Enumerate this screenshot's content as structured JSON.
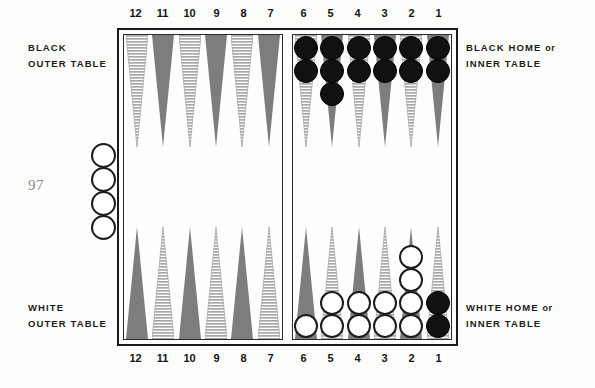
{
  "page": {
    "number": "97",
    "background_color": "#fdfdfb"
  },
  "labels": {
    "black_outer_line1": "BLACK",
    "black_outer_line2": "OUTER TABLE",
    "white_outer_line1": "WHITE",
    "white_outer_line2": "OUTER TABLE",
    "black_home_line1": "BLACK HOME",
    "black_home_or": "or",
    "black_home_line2": "INNER TABLE",
    "white_home_line1": "WHITE HOME",
    "white_home_or": "or",
    "white_home_line2": "INNER TABLE"
  },
  "point_numbers": {
    "outer": [
      "12",
      "11",
      "10",
      "9",
      "8",
      "7"
    ],
    "inner": [
      "6",
      "5",
      "4",
      "3",
      "2",
      "1"
    ]
  },
  "colors": {
    "point_dark": "#7d7d7d",
    "point_hatch": "#a8a8a8",
    "checker_black": "#111111",
    "checker_white": "#ffffff",
    "frame": "#1a1a1a",
    "text": "#1b1b1b",
    "page_number": "#8a8a8a"
  },
  "board": {
    "quadrants": {
      "black_outer": {
        "name": "BLACK OUTER TABLE",
        "position": "top-left",
        "points": [
          {
            "number": "12",
            "style": "hatch",
            "checkers": 0,
            "checker_color": ""
          },
          {
            "number": "11",
            "style": "dark",
            "checkers": 0,
            "checker_color": ""
          },
          {
            "number": "10",
            "style": "hatch",
            "checkers": 0,
            "checker_color": ""
          },
          {
            "number": "9",
            "style": "dark",
            "checkers": 0,
            "checker_color": ""
          },
          {
            "number": "8",
            "style": "hatch",
            "checkers": 0,
            "checker_color": ""
          },
          {
            "number": "7",
            "style": "dark",
            "checkers": 0,
            "checker_color": ""
          }
        ]
      },
      "black_home": {
        "name": "BLACK HOME or INNER TABLE",
        "position": "top-right",
        "points": [
          {
            "number": "6",
            "style": "hatch",
            "checkers": 2,
            "checker_color": "black"
          },
          {
            "number": "5",
            "style": "dark",
            "checkers": 3,
            "checker_color": "black"
          },
          {
            "number": "4",
            "style": "hatch",
            "checkers": 2,
            "checker_color": "black"
          },
          {
            "number": "3",
            "style": "dark",
            "checkers": 2,
            "checker_color": "black"
          },
          {
            "number": "2",
            "style": "hatch",
            "checkers": 2,
            "checker_color": "black"
          },
          {
            "number": "1",
            "style": "dark",
            "checkers": 2,
            "checker_color": "black"
          }
        ]
      },
      "white_outer": {
        "name": "WHITE OUTER TABLE",
        "position": "bottom-left",
        "points": [
          {
            "number": "12",
            "style": "dark",
            "checkers": 0,
            "checker_color": ""
          },
          {
            "number": "11",
            "style": "hatch",
            "checkers": 0,
            "checker_color": ""
          },
          {
            "number": "10",
            "style": "dark",
            "checkers": 0,
            "checker_color": ""
          },
          {
            "number": "9",
            "style": "hatch",
            "checkers": 0,
            "checker_color": ""
          },
          {
            "number": "8",
            "style": "dark",
            "checkers": 0,
            "checker_color": ""
          },
          {
            "number": "7",
            "style": "hatch",
            "checkers": 0,
            "checker_color": ""
          }
        ]
      },
      "white_home": {
        "name": "WHITE HOME or INNER TABLE",
        "position": "bottom-right",
        "points": [
          {
            "number": "6",
            "style": "dark",
            "checkers": 1,
            "checker_color": "white"
          },
          {
            "number": "5",
            "style": "hatch",
            "checkers": 2,
            "checker_color": "white"
          },
          {
            "number": "4",
            "style": "dark",
            "checkers": 2,
            "checker_color": "white"
          },
          {
            "number": "3",
            "style": "hatch",
            "checkers": 2,
            "checker_color": "white"
          },
          {
            "number": "2",
            "style": "dark",
            "checkers": 4,
            "checker_color": "white"
          },
          {
            "number": "1",
            "style": "hatch",
            "checkers": 2,
            "checker_color": "black"
          }
        ]
      }
    },
    "borne_off": {
      "side": "left-of-board",
      "color": "white",
      "count": 4
    }
  }
}
